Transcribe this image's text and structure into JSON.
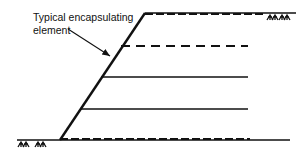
{
  "figure": {
    "annotation": {
      "line1": "Typical encapsulating",
      "line2": "element"
    },
    "colors": {
      "stroke": "#111111",
      "background": "#ffffff"
    },
    "elements": [
      {
        "type": "top-surface",
        "style": "solid+dashed"
      },
      {
        "type": "reinforcement-layer",
        "style": "dashed"
      },
      {
        "type": "reinforcement-layer",
        "style": "solid"
      },
      {
        "type": "reinforcement-layer",
        "style": "solid"
      },
      {
        "type": "ground-surface",
        "style": "solid+dashed"
      }
    ],
    "icons": [
      "grass-tuft-icon",
      "grass-tuft-icon",
      "grass-tuft-icon",
      "grass-tuft-icon"
    ]
  }
}
